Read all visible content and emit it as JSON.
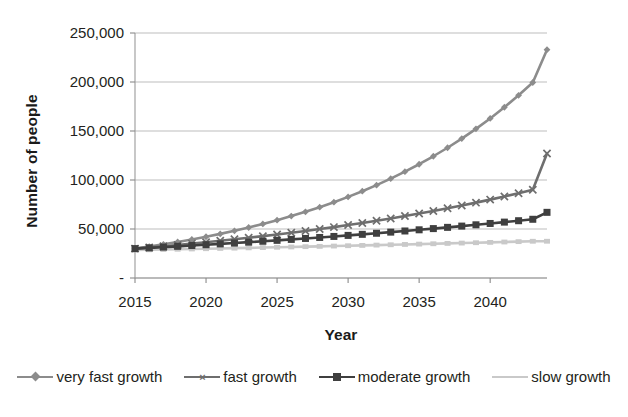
{
  "chart_data": {
    "type": "line",
    "title": "",
    "xlabel": "Year",
    "ylabel": "Number of people",
    "xlim": [
      2015,
      2044
    ],
    "ylim": [
      0,
      250000
    ],
    "grid": true,
    "legend_position": "bottom",
    "x_ticks": [
      "2015",
      "2020",
      "2025",
      "2030",
      "2035",
      "2040"
    ],
    "x_tick_values": [
      2015,
      2020,
      2025,
      2030,
      2035,
      2040
    ],
    "y_ticks": [
      "-",
      "50,000",
      "100,000",
      "150,000",
      "200,000",
      "250,000"
    ],
    "y_tick_values": [
      0,
      50000,
      100000,
      150000,
      200000,
      250000
    ],
    "x": [
      2015,
      2016,
      2017,
      2018,
      2019,
      2020,
      2021,
      2022,
      2023,
      2024,
      2025,
      2026,
      2027,
      2028,
      2029,
      2030,
      2031,
      2032,
      2033,
      2034,
      2035,
      2036,
      2037,
      2038,
      2039,
      2040,
      2041,
      2042,
      2043,
      2044
    ],
    "series": [
      {
        "name": "very fast growth",
        "color": "#8c8c8c",
        "marker": "diamond",
        "values": [
          30000,
          32100,
          34350,
          36750,
          39320,
          42070,
          45020,
          48170,
          51540,
          55150,
          59010,
          63140,
          67560,
          72290,
          77350,
          82770,
          88560,
          94760,
          101390,
          108490,
          116090,
          124220,
          132920,
          142220,
          152180,
          162830,
          174230,
          186430,
          199480,
          233000
        ]
      },
      {
        "name": "fast growth",
        "color": "#6e6e6e",
        "marker": "x",
        "values": [
          30000,
          31200,
          32450,
          33750,
          35100,
          36500,
          37960,
          39480,
          41060,
          42700,
          44410,
          46180,
          48030,
          49950,
          51950,
          54030,
          56190,
          58440,
          60780,
          63210,
          65740,
          68370,
          71110,
          73950,
          76910,
          79990,
          83190,
          86520,
          89980,
          127000
        ]
      },
      {
        "name": "moderate growth",
        "color": "#3f3f3f",
        "marker": "square",
        "values": [
          30000,
          30750,
          31520,
          32310,
          33120,
          33950,
          34800,
          35670,
          36560,
          37480,
          38420,
          39380,
          40360,
          41370,
          42410,
          43470,
          44560,
          45670,
          46810,
          47980,
          49180,
          50410,
          51670,
          52960,
          54280,
          55640,
          57030,
          58460,
          59920,
          67000
        ]
      },
      {
        "name": "slow growth",
        "color": "#c9c9c9",
        "marker": "none",
        "values": [
          28500,
          28770,
          29040,
          29320,
          29600,
          29880,
          30170,
          30460,
          30750,
          31050,
          31350,
          31660,
          31970,
          32280,
          32600,
          32920,
          33250,
          33580,
          33910,
          34250,
          34590,
          34940,
          35290,
          35640,
          36000,
          36360,
          36730,
          37100,
          37480,
          37500
        ]
      }
    ]
  },
  "axes": {
    "plot_left": 135,
    "plot_right": 547,
    "plot_top": 33,
    "plot_bottom": 278
  }
}
